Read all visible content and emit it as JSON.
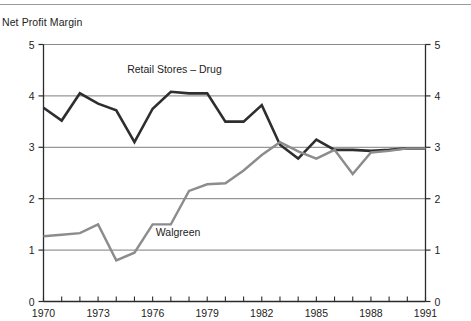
{
  "chart_data": {
    "type": "line",
    "title": "Net Profit Margin",
    "xlabel": "",
    "ylabel": "",
    "xlim": [
      1970,
      1991
    ],
    "ylim": [
      0,
      5
    ],
    "ytick_labels": [
      "0",
      "1",
      "2",
      "3",
      "4",
      "5"
    ],
    "ytick_values": [
      0,
      1,
      2,
      3,
      4,
      5
    ],
    "xtick_values": [
      1970,
      1971,
      1972,
      1973,
      1974,
      1975,
      1976,
      1977,
      1978,
      1979,
      1980,
      1981,
      1982,
      1983,
      1984,
      1985,
      1986,
      1987,
      1988,
      1989,
      1990,
      1991
    ],
    "xtick_labels_shown": [
      "1970",
      "1973",
      "1976",
      "1979",
      "1982",
      "1985",
      "1988",
      "1991"
    ],
    "xtick_labels_shown_values": [
      1970,
      1973,
      1976,
      1979,
      1982,
      1985,
      1988,
      1991
    ],
    "grid": "horizontal-only",
    "grid_values": [
      1,
      2,
      3,
      4
    ],
    "axis_right_mirrored": true,
    "legend": "inline-annotations",
    "x": [
      1970,
      1971,
      1972,
      1973,
      1974,
      1975,
      1976,
      1977,
      1978,
      1979,
      1980,
      1981,
      1982,
      1983,
      1984,
      1985,
      1986,
      1987,
      1988,
      1989,
      1990,
      1991
    ],
    "series": [
      {
        "name": "Retail Stores – Drug",
        "color": "#2e2e2e",
        "label_x": 1977.2,
        "label_y": 4.45,
        "values": [
          3.77,
          3.52,
          4.05,
          3.85,
          3.72,
          3.1,
          3.75,
          4.08,
          4.05,
          4.05,
          3.5,
          3.5,
          3.82,
          3.05,
          2.78,
          3.15,
          2.95,
          2.95,
          2.93,
          2.95,
          2.98,
          2.98
        ]
      },
      {
        "name": "Walgreen",
        "color": "#8c8c8c",
        "label_x": 1977.4,
        "label_y": 1.27,
        "values": [
          1.27,
          1.3,
          1.33,
          1.5,
          0.8,
          0.95,
          1.5,
          1.5,
          2.15,
          2.28,
          2.3,
          2.55,
          2.85,
          3.1,
          2.92,
          2.78,
          2.95,
          2.48,
          2.9,
          2.93,
          2.98,
          2.98
        ]
      }
    ]
  },
  "axes": {
    "left_axis_name": "y-axis-left",
    "right_axis_name": "y-axis-right",
    "bottom_axis_name": "x-axis"
  }
}
